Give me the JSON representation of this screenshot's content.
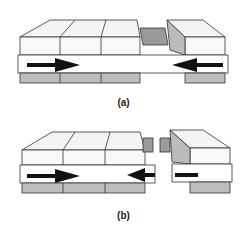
{
  "figure": {
    "panels": [
      {
        "id": "a",
        "caption": "(a)",
        "description": "Block slabs with left arrow pointing right and right arrow pointing left, converging at joint"
      },
      {
        "id": "b",
        "caption": "(b)",
        "description": "Block slabs separated at a gap; arrows converge and right block detached"
      }
    ]
  },
  "colors": {
    "line": "#333333",
    "shade": "#9a9a9a",
    "arrow": "#111111",
    "background": "#ffffff"
  }
}
